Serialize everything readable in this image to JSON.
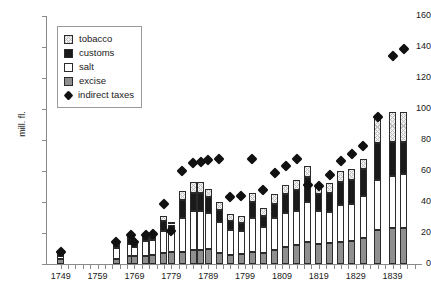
{
  "chart_data": {
    "type": "bar",
    "title": "",
    "subtitle": "",
    "xlabel": "",
    "ylabel": "mill. fl.",
    "ylim": [
      0,
      160
    ],
    "ytick_values": [
      0,
      20,
      40,
      60,
      80,
      100,
      120,
      140,
      160
    ],
    "xtick_labels": [
      "1749",
      "1759",
      "1769",
      "1779",
      "1789",
      "1799",
      "1809",
      "1819",
      "1829",
      "1839"
    ],
    "xtick_years": [
      1749,
      1759,
      1769,
      1779,
      1789,
      1799,
      1809,
      1819,
      1829,
      1839
    ],
    "xlim": [
      1745,
      1847
    ],
    "grid": false,
    "legend_position": "upper-left-inside",
    "stacking_order_bottom_to_top": [
      "excise",
      "salt",
      "customs",
      "tobacco"
    ],
    "legend": [
      {
        "label": "tobacco",
        "swatch": "hatched-light",
        "color": "#f2f2f2"
      },
      {
        "label": "customs",
        "swatch": "solid",
        "color": "#1a1a1a"
      },
      {
        "label": "salt",
        "swatch": "solid",
        "color": "#ffffff"
      },
      {
        "label": "excise",
        "swatch": "solid",
        "color": "#8f8f8f"
      },
      {
        "label": "indirect taxes",
        "swatch": "diamond-marker",
        "color": "#111111"
      }
    ],
    "series": [
      {
        "name": "excise",
        "color": "#8f8f8f"
      },
      {
        "name": "salt",
        "color": "#ffffff"
      },
      {
        "name": "customs",
        "color": "#1a1a1a"
      },
      {
        "name": "tobacco",
        "color": "#f2f2f2"
      }
    ],
    "marker_series": {
      "name": "indirect taxes",
      "color": "#111111"
    },
    "points": [
      {
        "year": 1749,
        "excise": 3.0,
        "salt": 2.0,
        "customs": 1.5,
        "tobacco": 0.5,
        "indirect_taxes": 8.0
      },
      {
        "year": 1764,
        "excise": 3.5,
        "salt": 7.0,
        "customs": 2.0,
        "tobacco": 0.5,
        "indirect_taxes": 14.0
      },
      {
        "year": 1768,
        "excise": 5.0,
        "salt": 8.0,
        "customs": 4.0,
        "tobacco": 1.0,
        "indirect_taxes": 18.5
      },
      {
        "year": 1769,
        "excise": 5.0,
        "salt": 6.0,
        "customs": 2.5,
        "tobacco": 0.5,
        "indirect_taxes": 14.5
      },
      {
        "year": 1772,
        "excise": 5.0,
        "salt": 10.0,
        "customs": 3.0,
        "tobacco": 0.5,
        "indirect_taxes": 19.0
      },
      {
        "year": 1774,
        "excise": 5.5,
        "salt": 10.0,
        "customs": 3.5,
        "tobacco": 0.5,
        "indirect_taxes": 19.5
      },
      {
        "year": 1777,
        "excise": 7.0,
        "salt": 14.0,
        "customs": 7.0,
        "tobacco": 3.0,
        "indirect_taxes": 38.5
      },
      {
        "year": 1779,
        "excise": 8.0,
        "salt": 13.5,
        "customs": 4.0,
        "tobacco": 1.0,
        "indirect_taxes": 21.0
      },
      {
        "year": 1782,
        "excise": 8.0,
        "salt": 22.0,
        "customs": 11.0,
        "tobacco": 6.0,
        "indirect_taxes": 60.0
      },
      {
        "year": 1785,
        "excise": 9.0,
        "salt": 25.0,
        "customs": 12.0,
        "tobacco": 7.0,
        "indirect_taxes": 65.0
      },
      {
        "year": 1787,
        "excise": 9.0,
        "salt": 25.0,
        "customs": 12.0,
        "tobacco": 7.0,
        "indirect_taxes": 66.0
      },
      {
        "year": 1789,
        "excise": 9.5,
        "salt": 23.5,
        "customs": 10.0,
        "tobacco": 5.5,
        "indirect_taxes": 67.0
      },
      {
        "year": 1792,
        "excise": 7.0,
        "salt": 20.0,
        "customs": 8.0,
        "tobacco": 5.0,
        "indirect_taxes": 68.0
      },
      {
        "year": 1795,
        "excise": 6.0,
        "salt": 16.0,
        "customs": 6.0,
        "tobacco": 4.0,
        "indirect_taxes": 43.5
      },
      {
        "year": 1798,
        "excise": 6.5,
        "salt": 15.0,
        "customs": 5.0,
        "tobacco": 4.5,
        "indirect_taxes": 44.0
      },
      {
        "year": 1801,
        "excise": 8.0,
        "salt": 22.0,
        "customs": 10.0,
        "tobacco": 6.0,
        "indirect_taxes": 68.0
      },
      {
        "year": 1804,
        "excise": 7.0,
        "salt": 17.0,
        "customs": 7.0,
        "tobacco": 5.0,
        "indirect_taxes": 48.0
      },
      {
        "year": 1807,
        "excise": 9.0,
        "salt": 21.0,
        "customs": 9.0,
        "tobacco": 6.0,
        "indirect_taxes": 59.0
      },
      {
        "year": 1810,
        "excise": 11.0,
        "salt": 22.0,
        "customs": 12.0,
        "tobacco": 6.0,
        "indirect_taxes": 63.0
      },
      {
        "year": 1813,
        "excise": 12.0,
        "salt": 22.0,
        "customs": 14.0,
        "tobacco": 6.0,
        "indirect_taxes": 68.0
      },
      {
        "year": 1816,
        "excise": 14.0,
        "salt": 26.0,
        "customs": 16.0,
        "tobacco": 7.0,
        "indirect_taxes": 51.0
      },
      {
        "year": 1819,
        "excise": 13.0,
        "salt": 21.0,
        "customs": 11.0,
        "tobacco": 6.0,
        "indirect_taxes": 50.5
      },
      {
        "year": 1822,
        "excise": 13.5,
        "salt": 20.0,
        "customs": 12.5,
        "tobacco": 6.0,
        "indirect_taxes": 57.5
      },
      {
        "year": 1825,
        "excise": 14.0,
        "salt": 24.0,
        "customs": 15.0,
        "tobacco": 7.0,
        "indirect_taxes": 66.5
      },
      {
        "year": 1828,
        "excise": 15.0,
        "salt": 24.0,
        "customs": 15.0,
        "tobacco": 7.0,
        "indirect_taxes": 71.0
      },
      {
        "year": 1831,
        "excise": 17.0,
        "salt": 27.0,
        "customs": 17.0,
        "tobacco": 7.0,
        "indirect_taxes": 76.0
      },
      {
        "year": 1835,
        "excise": 22.0,
        "salt": 32.0,
        "customs": 24.0,
        "tobacco": 17.0,
        "indirect_taxes": 95.0
      },
      {
        "year": 1839,
        "excise": 23.0,
        "salt": 34.0,
        "customs": 22.0,
        "tobacco": 19.0,
        "indirect_taxes": 134.0
      },
      {
        "year": 1842,
        "excise": 23.0,
        "salt": 35.0,
        "customs": 21.0,
        "tobacco": 19.0,
        "indirect_taxes": 139.0
      }
    ]
  }
}
